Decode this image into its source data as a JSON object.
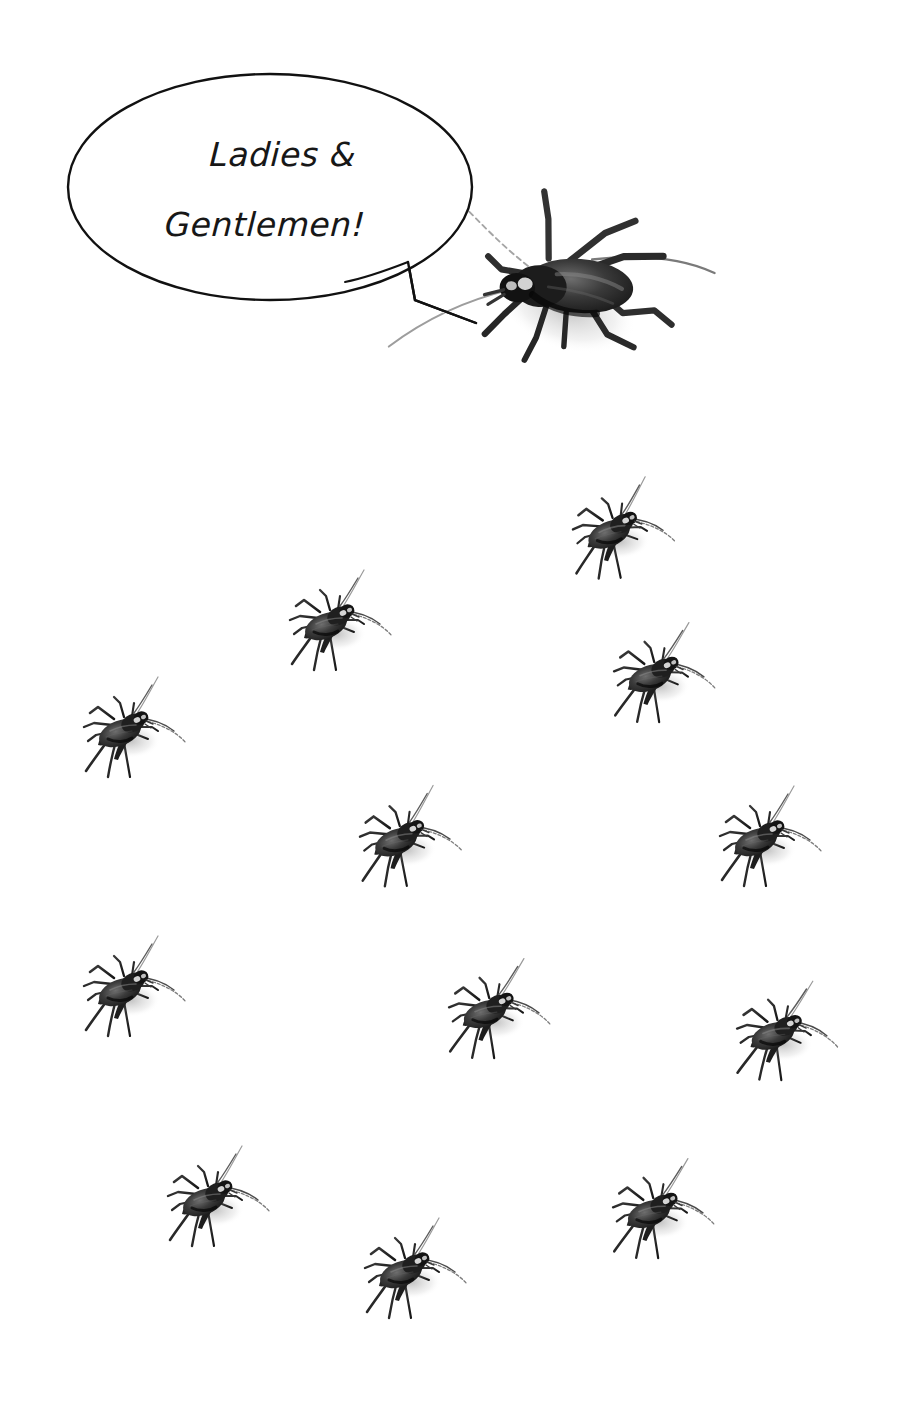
{
  "canvas": {
    "width": 911,
    "height": 1421,
    "background_color": "#ffffff"
  },
  "speech_bubble": {
    "name": "speech-bubble",
    "shape": "ellipse-with-angular-tail",
    "line_color": "#111111",
    "fill_color": "#ffffff",
    "stroke_width": 2.4,
    "ellipse": {
      "cx": 270,
      "cy": 187,
      "rx": 202,
      "ry": 113
    },
    "tail_points": "345,282 408,262 415,300 476,323",
    "text_line_1": "Ladies &",
    "text_line_2": "Gentlemen!",
    "text_color": "#171717"
  },
  "speaker": {
    "name": "speaker-cricket",
    "label": "cricket",
    "x": 430,
    "y": 178,
    "width": 272,
    "height": 230,
    "rotation": 0,
    "scale": 1.0,
    "color": "#2b2b2b"
  },
  "audience": {
    "label": "audience-crickets",
    "count": 12,
    "color": "#2b2b2b",
    "crickets": [
      {
        "id": 1,
        "x": 613,
        "y": 530,
        "scale": 1.0,
        "rotation": -2
      },
      {
        "id": 2,
        "x": 330,
        "y": 622,
        "scale": 1.0,
        "rotation": 0
      },
      {
        "id": 3,
        "x": 654,
        "y": 674,
        "scale": 1.0,
        "rotation": 1
      },
      {
        "id": 4,
        "x": 124,
        "y": 729,
        "scale": 1.0,
        "rotation": 0
      },
      {
        "id": 5,
        "x": 400,
        "y": 838,
        "scale": 1.0,
        "rotation": -1
      },
      {
        "id": 6,
        "x": 760,
        "y": 838,
        "scale": 1.0,
        "rotation": 0
      },
      {
        "id": 7,
        "x": 124,
        "y": 988,
        "scale": 1.0,
        "rotation": 0
      },
      {
        "id": 8,
        "x": 489,
        "y": 1010,
        "scale": 1.0,
        "rotation": 1
      },
      {
        "id": 9,
        "x": 777,
        "y": 1032,
        "scale": 1.0,
        "rotation": 2
      },
      {
        "id": 10,
        "x": 208,
        "y": 1198,
        "scale": 1.0,
        "rotation": 0
      },
      {
        "id": 11,
        "x": 653,
        "y": 1210,
        "scale": 1.0,
        "rotation": 1
      },
      {
        "id": 12,
        "x": 405,
        "y": 1270,
        "scale": 1.0,
        "rotation": 0
      }
    ]
  }
}
